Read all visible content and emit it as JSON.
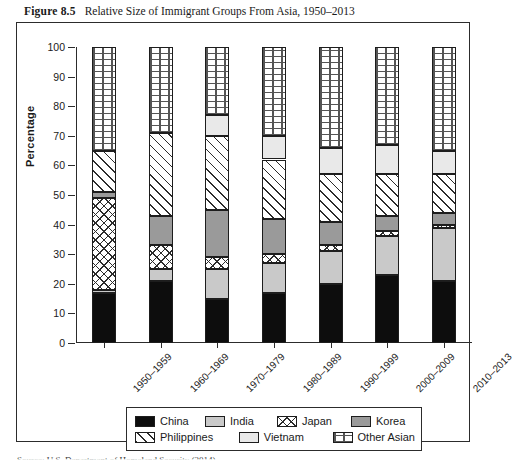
{
  "figure": {
    "label": "Figure 8.5",
    "title": "Relative Size of Immigrant Groups From Asia, 1950–2013",
    "source_note": "Source: U.S. Department of Homeland Security (2014)."
  },
  "chart_data": {
    "type": "bar",
    "variant": "stacked-100",
    "title": "Relative Size of Immigrant Groups From Asia, 1950–2013",
    "xlabel": "",
    "ylabel": "Percentage",
    "ylim": [
      0,
      100
    ],
    "yticks": [
      0,
      10,
      20,
      30,
      40,
      50,
      60,
      70,
      80,
      90,
      100
    ],
    "grid": false,
    "legend_position": "bottom",
    "categories": [
      "1950–1959",
      "1960–1969",
      "1970–1979",
      "1980–1989",
      "1990–1999",
      "2000–2009",
      "2010–2013"
    ],
    "series": [
      {
        "name": "China",
        "pattern": "solid-black",
        "color": "#0d0d0d",
        "values": [
          17,
          21,
          15,
          17,
          20,
          23,
          21
        ]
      },
      {
        "name": "India",
        "pattern": "light-gray",
        "color": "#c9c9c9",
        "values": [
          1,
          4,
          10,
          10,
          11,
          13,
          18
        ]
      },
      {
        "name": "Japan",
        "pattern": "crosshatch",
        "color": "#ffffff",
        "values": [
          31,
          8,
          4,
          3,
          2,
          2,
          1
        ]
      },
      {
        "name": "Korea",
        "pattern": "dark-gray",
        "color": "#9a9a9a",
        "values": [
          2,
          10,
          16,
          12,
          8,
          5,
          4
        ]
      },
      {
        "name": "Philippines",
        "pattern": "diagonal",
        "color": "#ffffff",
        "values": [
          14,
          28,
          25,
          20,
          16,
          14,
          13
        ]
      },
      {
        "name": "Vietnam",
        "pattern": "very-light",
        "color": "#e9e9e9",
        "values": [
          0,
          0,
          7,
          8,
          9,
          10,
          8
        ]
      },
      {
        "name": "Other Asian",
        "pattern": "dotted",
        "color": "#ffffff",
        "values": [
          35,
          29,
          23,
          30,
          34,
          33,
          35
        ]
      }
    ],
    "cumulative_tops": {
      "1950–1959": [
        17,
        18,
        49,
        51,
        65,
        65,
        100
      ],
      "1960–1969": [
        21,
        25,
        33,
        43,
        71,
        71,
        100
      ],
      "1970–1979": [
        15,
        25,
        29,
        45,
        70,
        77,
        100
      ],
      "1980–1989": [
        17,
        27,
        30,
        42,
        62,
        70,
        100
      ],
      "1990–1999": [
        20,
        31,
        33,
        41,
        57,
        66,
        100
      ],
      "2000–2009": [
        23,
        36,
        38,
        43,
        57,
        67,
        100
      ],
      "2010–2013": [
        21,
        39,
        40,
        44,
        57,
        65,
        100
      ]
    }
  }
}
